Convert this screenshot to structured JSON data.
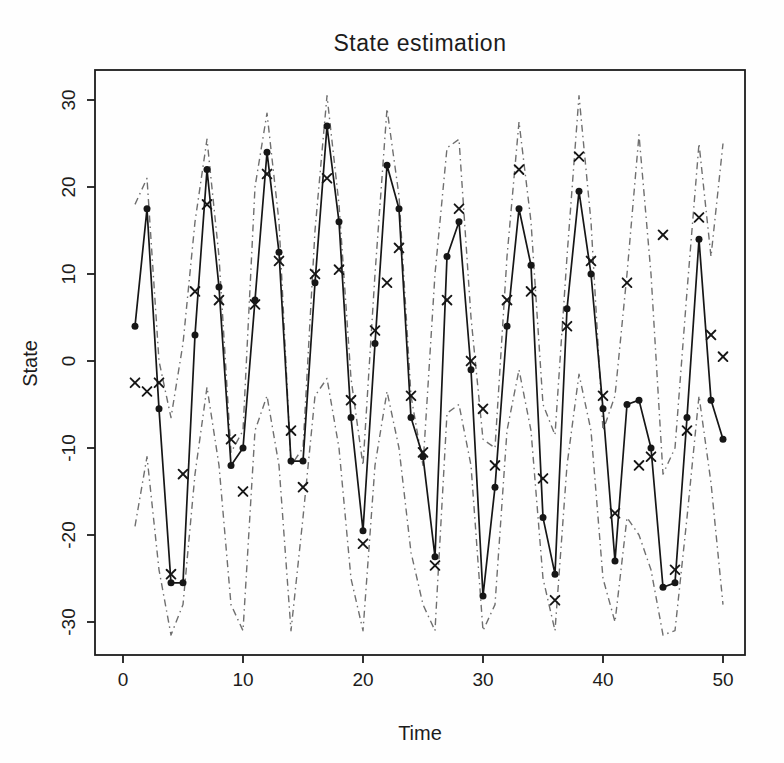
{
  "chart_data": {
    "type": "line",
    "title": "State estimation",
    "xlabel": "Time",
    "ylabel": "State",
    "xlim": [
      0,
      50
    ],
    "ylim": [
      -30,
      30
    ],
    "xticks": [
      0,
      10,
      20,
      30,
      40,
      50
    ],
    "yticks": [
      -30,
      -20,
      -10,
      0,
      10,
      20,
      30
    ],
    "grid": false,
    "legend": null,
    "x": [
      1,
      2,
      3,
      4,
      5,
      6,
      7,
      8,
      9,
      10,
      11,
      12,
      13,
      14,
      15,
      16,
      17,
      18,
      19,
      20,
      21,
      22,
      23,
      24,
      25,
      26,
      27,
      28,
      29,
      30,
      31,
      32,
      33,
      34,
      35,
      36,
      37,
      38,
      39,
      40,
      41,
      42,
      43,
      44,
      45,
      46,
      47,
      48,
      49,
      50
    ],
    "series": [
      {
        "name": "state-estimate",
        "label": "filtered state estimate",
        "draw": "line-with-points",
        "marker": "filled-circle",
        "color": "#161616",
        "values": [
          4,
          17.5,
          -5.5,
          -25.5,
          -25.5,
          3,
          22,
          8.5,
          -12,
          -10,
          7,
          24,
          12.5,
          -11.5,
          -11.5,
          9,
          27,
          16,
          -6.5,
          -19.5,
          2,
          22.5,
          17.5,
          -6.5,
          -11,
          -22.5,
          12,
          16,
          -1,
          -27,
          -14.5,
          4,
          17.5,
          11,
          -18,
          -24.5,
          6,
          19.5,
          10,
          -5.5,
          -23,
          -5,
          -4.5,
          -10,
          -26,
          -25.5,
          -6.5,
          14,
          -4.5,
          -9
        ]
      },
      {
        "name": "observations",
        "label": "observations",
        "draw": "points",
        "marker": "x-cross",
        "color": "#161616",
        "values": [
          -2.5,
          -3.5,
          -2.5,
          -24.5,
          -13,
          8,
          18,
          7,
          -9,
          -15,
          6.5,
          21.5,
          11.5,
          -8,
          -14.5,
          10,
          21,
          10.5,
          -4.5,
          -21,
          3.5,
          9,
          13,
          -4,
          -10.5,
          -23.5,
          7,
          17.5,
          0,
          -5.5,
          -12,
          7,
          22,
          8,
          -13.5,
          -27.5,
          4,
          23.5,
          11.5,
          -4,
          -17.5,
          9,
          -12,
          -11,
          14.5,
          -24,
          -8,
          16.5,
          3,
          0.5
        ]
      },
      {
        "name": "upper-confidence-bound",
        "label": "upper confidence bound",
        "draw": "line",
        "style": "dash-dot",
        "color": "#6f6f6f",
        "values": [
          18,
          21,
          0,
          -6.5,
          2,
          16,
          25.5,
          12,
          -10.5,
          -8,
          20,
          28.5,
          16,
          -12,
          -10,
          15,
          30.5,
          18,
          -2,
          -12,
          10,
          29,
          19,
          -4,
          -12,
          10,
          24.5,
          25.5,
          5,
          -9,
          -10,
          12,
          27.5,
          16,
          -5,
          -8.5,
          12,
          30.5,
          16,
          -8,
          -4,
          10,
          26,
          10,
          -13,
          -10,
          8,
          25,
          12,
          25
        ]
      },
      {
        "name": "lower-confidence-bound",
        "label": "lower confidence bound",
        "draw": "line",
        "style": "dash-dot",
        "color": "#6f6f6f",
        "values": [
          -19,
          -11,
          -24,
          -31.5,
          -28,
          -13,
          -3,
          -12,
          -28,
          -31,
          -8,
          -4,
          -12,
          -31,
          -18,
          -4,
          -2,
          -10,
          -25,
          -31,
          -12,
          -3.5,
          -10,
          -22,
          -28,
          -31,
          -6,
          -5,
          -12,
          -31,
          -28,
          -8,
          -1,
          -8,
          -25,
          -31,
          -12,
          -1.5,
          -8,
          -25,
          -30,
          -18,
          -20,
          -24,
          -31.5,
          -31,
          -18,
          -4,
          -14,
          -28
        ]
      }
    ]
  }
}
